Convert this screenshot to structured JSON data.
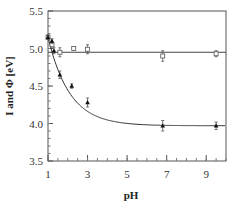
{
  "chart_data": {
    "type": "scatter",
    "title": "",
    "xlabel": "pH",
    "ylabel": "I and Φ    [eV]",
    "xlim": [
      1,
      10
    ],
    "ylim": [
      3.5,
      5.5
    ],
    "x_ticks": [
      1,
      3,
      5,
      7,
      9
    ],
    "x_tick_labels": [
      "1",
      "3",
      "5",
      "7",
      "9"
    ],
    "y_ticks": [
      3.5,
      4.0,
      4.5,
      5.0,
      5.5
    ],
    "y_tick_labels": [
      "3.5",
      "4.0",
      "4.5",
      "5.0",
      "5.5"
    ],
    "grid": false,
    "legend": null,
    "series": [
      {
        "name": "Φ (open squares)",
        "marker": "open-square",
        "x": [
          1.0,
          1.2,
          1.6,
          2.3,
          3.0,
          6.8,
          9.5
        ],
        "y": [
          5.15,
          5.05,
          4.95,
          5.0,
          4.99,
          4.9,
          4.93
        ],
        "err": [
          0.03,
          0.03,
          0.06,
          0.02,
          0.06,
          0.07,
          0.04
        ],
        "fit": {
          "type": "constant",
          "value": 4.95
        }
      },
      {
        "name": "I (filled triangles)",
        "marker": "filled-triangle",
        "x": [
          1.0,
          1.2,
          1.3,
          1.6,
          2.2,
          3.0,
          6.8,
          9.5
        ],
        "y": [
          5.15,
          5.1,
          4.97,
          4.65,
          4.5,
          4.28,
          3.97,
          3.97
        ],
        "err": [
          0.03,
          0.03,
          0.04,
          0.05,
          0.03,
          0.06,
          0.07,
          0.05
        ],
        "fit": {
          "type": "exponential-decay",
          "asymptote": 3.97,
          "start": 5.15
        }
      }
    ]
  }
}
